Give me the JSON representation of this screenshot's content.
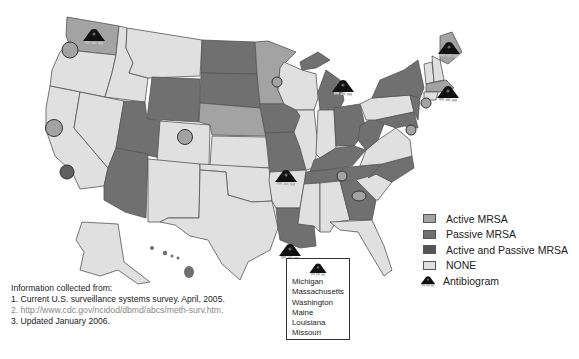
{
  "colors": {
    "active_mrsa": "#a3a3a3",
    "passive_mrsa": "#707070",
    "active_and_passive_mrsa": "#555555",
    "none": "#e0e0e0",
    "border": "#555555",
    "antibiogram": "#111111"
  },
  "legend": {
    "items": [
      {
        "label": "Active MRSA",
        "key": "active_mrsa"
      },
      {
        "label": "Passive MRSA",
        "key": "passive_mrsa"
      },
      {
        "label": "Active and Passive MRSA",
        "key": "active_and_passive_mrsa"
      },
      {
        "label": "NONE",
        "key": "none"
      },
      {
        "label": "Antibiogram",
        "key": "antibiogram",
        "icon": "antibiogram-icon"
      }
    ]
  },
  "info": {
    "heading": "Information collected from:",
    "lines": [
      "1. Current U.S. surveillance systems survey. April, 2005.",
      "2. http://www.cdc.gov/ncidod/dbmd/abcs/meth-surv.htm.",
      "3. Updated January 2006."
    ]
  },
  "antibiogram_box": {
    "icon": "antibiogram-icon",
    "states": [
      "Michigan",
      "Massachusetts",
      "Washington",
      "Maine",
      "Louisiana",
      "Missouri"
    ]
  },
  "map": {
    "state_categories": {
      "passive_mrsa": [
        "Wyoming",
        "Utah",
        "Arizona",
        "North Dakota",
        "South Dakota",
        "Iowa",
        "Missouri",
        "Michigan",
        "Ohio",
        "West Virginia",
        "Kentucky",
        "Tennessee",
        "North Carolina",
        "Georgia",
        "Louisiana",
        "New York",
        "New Jersey",
        "Maryland",
        "Hawaii"
      ],
      "active_mrsa": [
        "Washington",
        "Minnesota",
        "Nebraska",
        "Maine",
        "Massachusetts"
      ],
      "active_and_passive_mrsa": [],
      "none": [
        "Oregon",
        "California",
        "Nevada",
        "Idaho",
        "Montana",
        "Colorado",
        "New Mexico",
        "Texas",
        "Oklahoma",
        "Kansas",
        "Arkansas",
        "Mississippi",
        "Alabama",
        "Florida",
        "South Carolina",
        "Virginia",
        "Illinois",
        "Indiana",
        "Wisconsin",
        "Pennsylvania",
        "Vermont",
        "New Hampshire",
        "Connecticut",
        "Alaska"
      ]
    },
    "active_markers": [
      "Oregon",
      "Northern California",
      "California (Bay Area)",
      "Colorado",
      "Minnesota",
      "Tennessee",
      "Georgia",
      "Connecticut",
      "Maryland"
    ],
    "antibiogram_markers": [
      "Washington",
      "Michigan",
      "Maine",
      "Massachusetts",
      "Missouri",
      "Louisiana"
    ]
  }
}
